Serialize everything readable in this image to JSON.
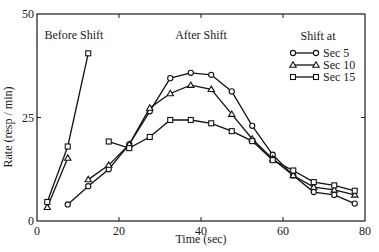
{
  "chart_data": {
    "type": "line",
    "title": "",
    "xlabel": "Time (sec)",
    "ylabel": "Rate (resp / min)",
    "xlim": [
      0,
      80
    ],
    "ylim": [
      0,
      50
    ],
    "xticks": [
      0,
      20,
      40,
      60,
      80
    ],
    "yticks": [
      0,
      25,
      50
    ],
    "grid": false,
    "annotations": [
      {
        "text": "Before Shift",
        "x": 9,
        "y": 45
      },
      {
        "text": "After Shift",
        "x": 40,
        "y": 45
      }
    ],
    "legend": {
      "title": "Shift at",
      "position": "upper right",
      "entries": [
        "Sec 5",
        "Sec 10",
        "Sec 15"
      ]
    },
    "series": [
      {
        "name": "Sec 5",
        "marker": "circle",
        "segments": [
          {
            "label": "after",
            "x": [
              7.5,
              12.5,
              17.5,
              22.5,
              27.5,
              32.5,
              37.5,
              42.5,
              47.5,
              52.5,
              57.5,
              62.5,
              67.5,
              72.5,
              77.5
            ],
            "y": [
              4.0,
              8.4,
              12.5,
              18.5,
              26.5,
              34.5,
              35.8,
              35.3,
              31.3,
              23.0,
              16.0,
              11.0,
              7.0,
              6.3,
              4.2
            ]
          }
        ]
      },
      {
        "name": "Sec 10",
        "marker": "triangle",
        "segments": [
          {
            "label": "before",
            "x": [
              2.5,
              7.5
            ],
            "y": [
              3.3,
              15.2
            ]
          },
          {
            "label": "after",
            "x": [
              12.5,
              17.5,
              22.5,
              27.5,
              32.5,
              37.5,
              42.5,
              47.5,
              52.5,
              57.5,
              62.5,
              67.5,
              72.5,
              77.5
            ],
            "y": [
              10.0,
              13.5,
              18.5,
              27.3,
              30.8,
              32.8,
              31.8,
              25.8,
              19.8,
              15.0,
              11.0,
              8.2,
              7.5,
              6.3
            ]
          }
        ]
      },
      {
        "name": "Sec 15",
        "marker": "square",
        "segments": [
          {
            "label": "before",
            "x": [
              2.5,
              7.5,
              12.5
            ],
            "y": [
              4.6,
              18.0,
              40.5
            ]
          },
          {
            "label": "after",
            "x": [
              17.5,
              22.5,
              27.5,
              32.5,
              37.5,
              42.5,
              47.5,
              52.5,
              57.5,
              62.5,
              67.5,
              72.5,
              77.5
            ],
            "y": [
              19.2,
              17.6,
              20.3,
              24.4,
              24.4,
              23.6,
              21.7,
              19.3,
              14.7,
              12.2,
              9.4,
              8.6,
              7.3
            ]
          }
        ]
      }
    ]
  },
  "colors": {
    "ink": "#111111",
    "background": "#ffffff"
  }
}
